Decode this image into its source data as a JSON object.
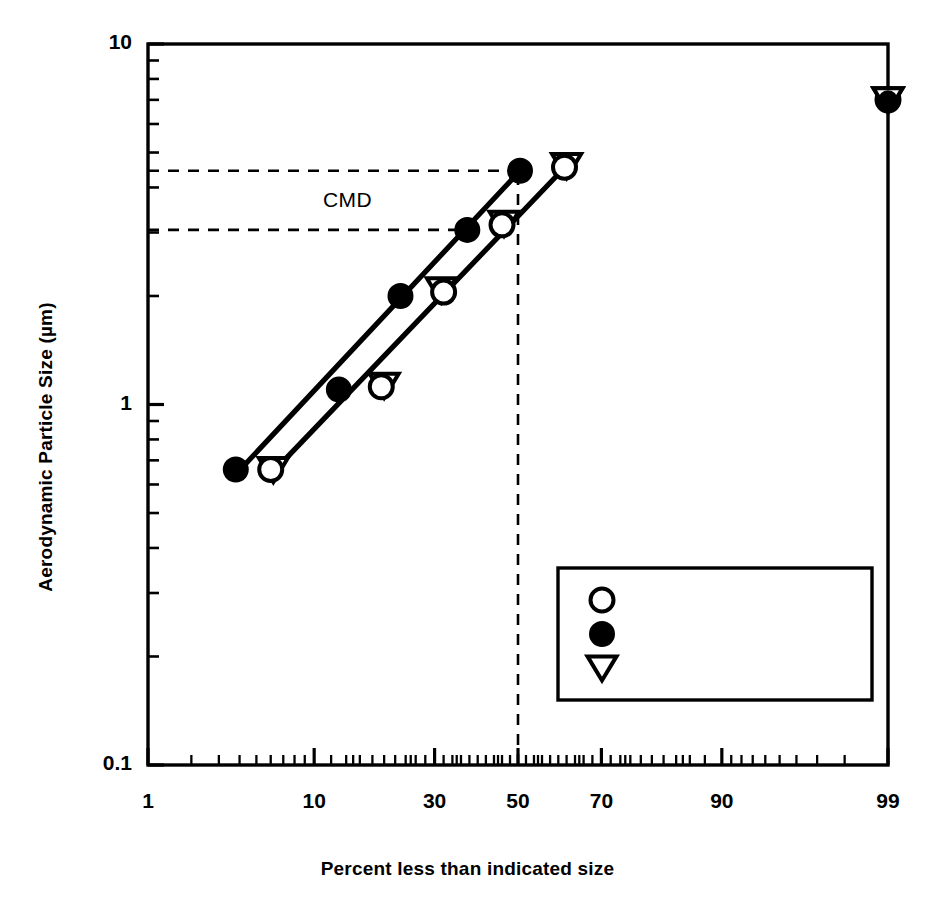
{
  "chart_data": {
    "type": "scatter",
    "title": "",
    "xlabel": "Percent less than indicated size",
    "ylabel": "Aerodynamic Particle Size (µm)",
    "xscale": "probability",
    "yscale": "log",
    "xlim": [
      1,
      99
    ],
    "ylim": [
      0.1,
      10
    ],
    "xticks": [
      "1",
      "10",
      "30",
      "50",
      "70",
      "90",
      "99"
    ],
    "xtick_values": [
      1,
      10,
      30,
      50,
      70,
      90,
      99
    ],
    "yticks": [
      "0.1",
      "1",
      "10"
    ],
    "ytick_values": [
      0.1,
      1,
      10
    ],
    "grid": false,
    "legend_position": "lower-right",
    "series": [
      {
        "name": "0600 < t < 1100",
        "marker": "open-circle",
        "points": [
          {
            "x": 6.0,
            "y": 0.66
          },
          {
            "x": 19.5,
            "y": 1.12
          },
          {
            "x": 32.0,
            "y": 2.05
          },
          {
            "x": 46.0,
            "y": 3.15
          },
          {
            "x": 61.5,
            "y": 4.55
          },
          {
            "x": 99.0,
            "y": 7.0
          }
        ]
      },
      {
        "name": "1100 < t < 1600",
        "marker": "filled-circle",
        "points": [
          {
            "x": 3.8,
            "y": 0.66
          },
          {
            "x": 13.0,
            "y": 1.1
          },
          {
            "x": 23.0,
            "y": 2.0
          },
          {
            "x": 37.5,
            "y": 3.05
          },
          {
            "x": 50.5,
            "y": 4.45
          },
          {
            "x": 99.0,
            "y": 7.0
          }
        ]
      },
      {
        "name": "1600 < t < 2200",
        "marker": "open-triangle-down",
        "points": [
          {
            "x": 6.2,
            "y": 0.66
          },
          {
            "x": 20.0,
            "y": 1.13
          },
          {
            "x": 31.5,
            "y": 2.08
          },
          {
            "x": 46.5,
            "y": 3.18
          },
          {
            "x": 62.0,
            "y": 4.6
          },
          {
            "x": 99.0,
            "y": 7.0
          }
        ]
      }
    ],
    "fit_lines": [
      {
        "name": "fit-line-upper",
        "x1": 3.8,
        "y1": 0.64,
        "x2": 50.5,
        "y2": 4.45
      },
      {
        "name": "fit-line-lower",
        "x1": 6.0,
        "y1": 0.64,
        "x2": 62.0,
        "y2": 4.6
      }
    ],
    "annotations": {
      "cmd_label": "CMD",
      "cmd_lines": [
        {
          "name": "cmd-upper-dashed",
          "y": 4.45,
          "x_from": 1,
          "x_to": 50.5
        },
        {
          "name": "cmd-lower-dashed",
          "y": 3.05,
          "x_from": 1,
          "x_to": 37.5
        }
      ],
      "median_line": {
        "name": "median-vertical-dashed",
        "x": 50,
        "y_from": 0.1,
        "y_to": 4.45
      }
    }
  },
  "legend": {
    "items": [
      {
        "marker": "open-circle",
        "label": "0600 < t < 1100"
      },
      {
        "marker": "filled-circle",
        "label": "1100 < t < 1600"
      },
      {
        "marker": "open-triangle-down",
        "label": "1600 < t < 2200"
      }
    ]
  },
  "colors": {
    "foreground": "#000000",
    "background": "#ffffff"
  }
}
